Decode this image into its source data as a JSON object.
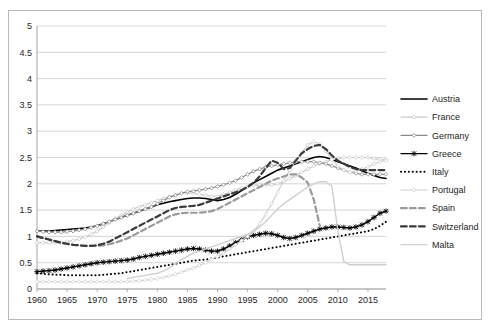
{
  "chart_data": {
    "type": "line",
    "title": "",
    "xlabel": "",
    "ylabel": "",
    "xlim": [
      1960,
      2018
    ],
    "ylim": [
      0,
      5
    ],
    "ytick_step": 0.5,
    "xtick_step": 5,
    "grid": true,
    "legend_position": "right",
    "ytick_labels": [
      "0",
      "0.5",
      "1",
      "1.5",
      "2",
      "2.5",
      "3",
      "3.5",
      "4",
      "4.5",
      "5"
    ],
    "ytick_values": [
      0,
      0.5,
      1,
      1.5,
      2,
      2.5,
      3,
      3.5,
      4,
      4.5,
      5
    ],
    "xtick_labels": [
      "1960",
      "1965",
      "1970",
      "1975",
      "1980",
      "1985",
      "1990",
      "1995",
      "2000",
      "2005",
      "2010",
      "2015"
    ],
    "xtick_values": [
      1960,
      1965,
      1970,
      1975,
      1980,
      1985,
      1990,
      1995,
      2000,
      2005,
      2010,
      2015
    ],
    "x": [
      1960,
      1961,
      1962,
      1963,
      1964,
      1965,
      1966,
      1967,
      1968,
      1969,
      1970,
      1971,
      1972,
      1973,
      1974,
      1975,
      1976,
      1977,
      1978,
      1979,
      1980,
      1981,
      1982,
      1983,
      1984,
      1985,
      1986,
      1987,
      1988,
      1989,
      1990,
      1991,
      1992,
      1993,
      1994,
      1995,
      1996,
      1997,
      1998,
      1999,
      2000,
      2001,
      2002,
      2003,
      2004,
      2005,
      2006,
      2007,
      2008,
      2009,
      2010,
      2011,
      2012,
      2013,
      2014,
      2015,
      2016,
      2017,
      2018
    ],
    "series": [
      {
        "name": "Austria",
        "color": "#000000",
        "style": "solid",
        "width": 1.6,
        "marker": "none",
        "values": [
          1.1,
          1.1,
          1.1,
          1.11,
          1.12,
          1.13,
          1.14,
          1.15,
          1.16,
          1.18,
          1.2,
          1.24,
          1.28,
          1.32,
          1.36,
          1.4,
          1.44,
          1.48,
          1.52,
          1.56,
          1.6,
          1.63,
          1.66,
          1.68,
          1.7,
          1.72,
          1.73,
          1.73,
          1.72,
          1.7,
          1.68,
          1.7,
          1.74,
          1.8,
          1.87,
          1.95,
          2.02,
          2.08,
          2.14,
          2.2,
          2.26,
          2.3,
          2.34,
          2.38,
          2.42,
          2.46,
          2.5,
          2.52,
          2.5,
          2.46,
          2.42,
          2.38,
          2.34,
          2.3,
          2.25,
          2.2,
          2.16,
          2.12,
          2.1
        ]
      },
      {
        "name": "France",
        "color": "#c9c9c9",
        "style": "solid",
        "width": 1.2,
        "marker": "diamond",
        "values": [
          0.88,
          0.88,
          0.88,
          0.88,
          0.88,
          0.9,
          0.92,
          0.95,
          0.99,
          1.04,
          1.1,
          1.18,
          1.26,
          1.34,
          1.4,
          1.46,
          1.52,
          1.56,
          1.6,
          1.64,
          1.68,
          1.72,
          1.76,
          1.79,
          1.82,
          1.83,
          1.82,
          1.8,
          1.78,
          1.76,
          1.76,
          1.8,
          1.84,
          1.88,
          1.92,
          1.95,
          1.97,
          1.98,
          1.98,
          1.98,
          2.0,
          2.04,
          2.1,
          2.16,
          2.22,
          2.28,
          2.34,
          2.38,
          2.42,
          2.46,
          2.48,
          2.5,
          2.5,
          2.5,
          2.5,
          2.5,
          2.48,
          2.46,
          2.46
        ]
      },
      {
        "name": "Germany",
        "color": "#8c8c8c",
        "style": "solid",
        "width": 1.2,
        "marker": "diamond",
        "values": [
          1.1,
          1.09,
          1.08,
          1.08,
          1.08,
          1.09,
          1.1,
          1.12,
          1.14,
          1.17,
          1.2,
          1.24,
          1.28,
          1.32,
          1.36,
          1.4,
          1.44,
          1.48,
          1.52,
          1.56,
          1.62,
          1.68,
          1.74,
          1.78,
          1.82,
          1.85,
          1.86,
          1.88,
          1.9,
          1.92,
          1.95,
          1.98,
          2.02,
          2.06,
          2.12,
          2.18,
          2.24,
          2.28,
          2.32,
          2.34,
          2.36,
          2.38,
          2.4,
          2.42,
          2.42,
          2.42,
          2.42,
          2.4,
          2.38,
          2.34,
          2.3,
          2.26,
          2.22,
          2.2,
          2.18,
          2.18,
          2.18,
          2.18,
          2.18
        ]
      },
      {
        "name": "Greece",
        "color": "#000000",
        "style": "solid",
        "width": 1.4,
        "marker": "star",
        "values": [
          0.33,
          0.34,
          0.35,
          0.36,
          0.38,
          0.4,
          0.42,
          0.44,
          0.46,
          0.48,
          0.5,
          0.51,
          0.52,
          0.53,
          0.54,
          0.55,
          0.57,
          0.6,
          0.62,
          0.64,
          0.66,
          0.68,
          0.7,
          0.72,
          0.74,
          0.76,
          0.77,
          0.76,
          0.74,
          0.72,
          0.72,
          0.76,
          0.82,
          0.88,
          0.94,
          0.99,
          1.02,
          1.04,
          1.06,
          1.05,
          1.02,
          0.98,
          0.96,
          0.98,
          1.02,
          1.06,
          1.1,
          1.14,
          1.16,
          1.18,
          1.18,
          1.17,
          1.16,
          1.18,
          1.22,
          1.28,
          1.36,
          1.44,
          1.48
        ]
      },
      {
        "name": "Italy",
        "color": "#000000",
        "style": "dotted",
        "width": 2.0,
        "marker": "none",
        "values": [
          0.3,
          0.29,
          0.28,
          0.27,
          0.27,
          0.26,
          0.26,
          0.26,
          0.26,
          0.26,
          0.26,
          0.27,
          0.28,
          0.29,
          0.3,
          0.32,
          0.34,
          0.36,
          0.38,
          0.4,
          0.42,
          0.44,
          0.46,
          0.48,
          0.5,
          0.52,
          0.54,
          0.55,
          0.56,
          0.58,
          0.6,
          0.62,
          0.64,
          0.66,
          0.68,
          0.7,
          0.72,
          0.74,
          0.76,
          0.78,
          0.8,
          0.82,
          0.84,
          0.86,
          0.88,
          0.9,
          0.92,
          0.94,
          0.96,
          0.98,
          1.0,
          1.02,
          1.04,
          1.06,
          1.08,
          1.1,
          1.14,
          1.2,
          1.28
        ]
      },
      {
        "name": "Portugal",
        "color": "#d0d0d0",
        "style": "solid",
        "width": 1.2,
        "marker": "diamond",
        "values": [
          0.14,
          0.14,
          0.14,
          0.14,
          0.14,
          0.14,
          0.14,
          0.14,
          0.14,
          0.14,
          0.14,
          0.14,
          0.14,
          0.14,
          0.14,
          0.14,
          0.15,
          0.16,
          0.17,
          0.18,
          0.2,
          0.22,
          0.25,
          0.28,
          0.32,
          0.36,
          0.4,
          0.45,
          0.5,
          0.56,
          0.62,
          0.68,
          0.76,
          0.84,
          0.92,
          1.0,
          1.1,
          1.24,
          1.42,
          1.62,
          1.84,
          2.06,
          2.26,
          2.44,
          2.6,
          2.74,
          2.8,
          2.76,
          2.62,
          2.46,
          2.34,
          2.26,
          2.22,
          2.24,
          2.28,
          2.32,
          2.38,
          2.42,
          2.44
        ]
      },
      {
        "name": "Spain",
        "color": "#9a9a9a",
        "style": "dashed",
        "width": 2.2,
        "marker": "none",
        "values": [
          1.0,
          0.97,
          0.94,
          0.91,
          0.88,
          0.86,
          0.84,
          0.83,
          0.82,
          0.82,
          0.82,
          0.83,
          0.85,
          0.88,
          0.92,
          0.96,
          1.02,
          1.08,
          1.14,
          1.2,
          1.26,
          1.32,
          1.38,
          1.42,
          1.44,
          1.45,
          1.45,
          1.45,
          1.46,
          1.48,
          1.52,
          1.58,
          1.64,
          1.7,
          1.76,
          1.82,
          1.88,
          1.94,
          2.0,
          2.06,
          2.1,
          2.14,
          2.18,
          2.18,
          2.12,
          2.02,
          1.7,
          1.2,
          null,
          null,
          null,
          null,
          null,
          null,
          null,
          null,
          null,
          null,
          null
        ]
      },
      {
        "name": "Switzerland",
        "color": "#3a3a3a",
        "style": "dashed",
        "width": 2.2,
        "marker": "none",
        "values": [
          1.0,
          0.97,
          0.94,
          0.91,
          0.88,
          0.86,
          0.84,
          0.83,
          0.82,
          0.82,
          0.83,
          0.86,
          0.9,
          0.96,
          1.02,
          1.08,
          1.14,
          1.2,
          1.26,
          1.32,
          1.38,
          1.44,
          1.5,
          1.54,
          1.56,
          1.57,
          1.58,
          1.6,
          1.64,
          1.68,
          1.72,
          1.76,
          1.8,
          1.84,
          1.88,
          1.94,
          2.02,
          2.14,
          2.3,
          2.44,
          2.4,
          2.28,
          2.3,
          2.44,
          2.58,
          2.66,
          2.72,
          2.74,
          2.66,
          2.54,
          2.44,
          2.38,
          2.32,
          2.28,
          2.26,
          2.26,
          2.26,
          2.26,
          2.26
        ]
      },
      {
        "name": "Malta",
        "color": "#cfcfcf",
        "style": "solid",
        "width": 1.4,
        "marker": "none",
        "values": [
          null,
          null,
          null,
          null,
          null,
          null,
          null,
          null,
          null,
          null,
          null,
          null,
          null,
          null,
          null,
          0.2,
          0.22,
          0.24,
          0.26,
          0.28,
          0.3,
          0.34,
          0.4,
          0.48,
          0.56,
          0.62,
          0.68,
          0.72,
          0.76,
          0.8,
          0.84,
          0.88,
          0.92,
          0.96,
          1.0,
          1.04,
          1.1,
          1.18,
          1.28,
          1.4,
          1.52,
          1.62,
          1.7,
          1.78,
          1.86,
          1.94,
          2.0,
          2.04,
          2.04,
          1.96,
          1.1,
          0.52,
          0.46,
          0.46,
          0.46,
          0.46,
          0.46,
          0.46,
          0.46
        ]
      }
    ]
  },
  "legend": {
    "entries": [
      {
        "label": "Austria"
      },
      {
        "label": "France"
      },
      {
        "label": "Germany"
      },
      {
        "label": "Greece"
      },
      {
        "label": "Italy"
      },
      {
        "label": "Portugal"
      },
      {
        "label": "Spain"
      },
      {
        "label": "Switzerland"
      },
      {
        "label": "Malta"
      }
    ]
  }
}
